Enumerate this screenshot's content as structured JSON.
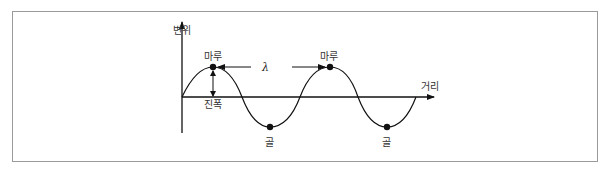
{
  "diagram": {
    "type": "transverse-wave",
    "labels": {
      "y_axis": "변위",
      "x_axis": "거리",
      "crest_1": "마루",
      "crest_2": "마루",
      "trough_1": "골",
      "trough_2": "골",
      "amplitude": "진폭",
      "wavelength": "λ"
    },
    "colors": {
      "line": "#111111",
      "text": "#333333",
      "frame": "#9a9a9a"
    },
    "geometry": {
      "origin": [
        182,
        97
      ],
      "period_px": 117,
      "amplitude_px": 30,
      "crests": [
        [
          213,
          67
        ],
        [
          330,
          67
        ]
      ],
      "troughs": [
        [
          270,
          127
        ],
        [
          387,
          127
        ]
      ]
    }
  }
}
